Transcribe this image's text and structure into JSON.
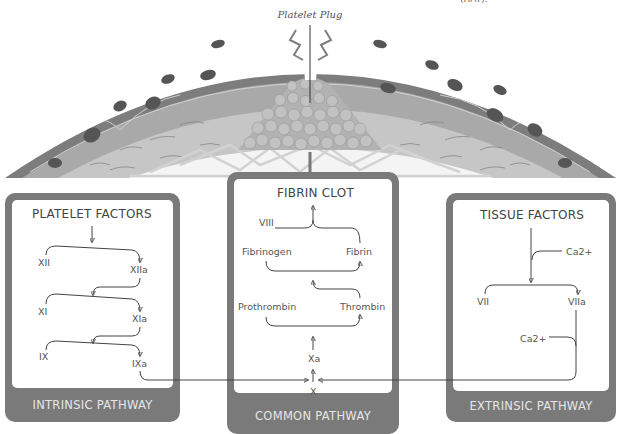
{
  "top_note": "(HAT).",
  "illustration": {
    "label": "Platelet Plug",
    "colors": {
      "outer_wall": "#7d7d7d",
      "cell_layer": "#a9a9a9",
      "nucleus": "#555555",
      "fiber_layer": "#c6c6c6",
      "platelets": "#b8b8b8",
      "fibrin_mesh": "#d8d8d8"
    }
  },
  "intrinsic": {
    "title": "PLATELET FACTORS",
    "footer": "INTRINSIC PATHWAY",
    "factors": [
      "XII",
      "XIIa",
      "XI",
      "XIa",
      "IX",
      "IXa"
    ]
  },
  "common": {
    "title": "FIBRIN CLOT",
    "footer": "COMMON PATHWAY",
    "factors": {
      "viii": "VIII",
      "fibrinogen": "Fibrinogen",
      "fibrin": "Fibrin",
      "prothrombin": "Prothrombin",
      "thrombin": "Thrombin",
      "xa": "Xa",
      "x": "X"
    }
  },
  "extrinsic": {
    "title": "TISSUE FACTORS",
    "footer": "EXTRINSIC PATHWAY",
    "factors": {
      "ca1": "Ca2+",
      "vii": "VII",
      "viia": "VIIa",
      "ca2": "Ca2+"
    }
  },
  "colors": {
    "panel": "#7a7a7a",
    "footer_text": "#e6e6e6",
    "line": "#444444"
  }
}
